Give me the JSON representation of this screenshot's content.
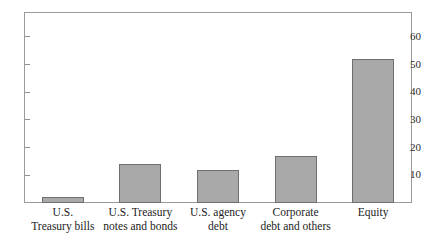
{
  "chart_data": {
    "type": "bar",
    "title": "",
    "xlabel": "",
    "ylabel": "",
    "ylim": [
      0,
      69
    ],
    "grid": false,
    "legend": false,
    "yticks": [
      10,
      20,
      30,
      40,
      50,
      60
    ],
    "ytick_labels": [
      "10",
      "20",
      "30",
      "40",
      "50",
      "60"
    ],
    "categories": [
      "U.S. Treasury bills",
      "U.S. Treasury notes and bonds",
      "U.S. agency debt",
      "Corporate debt and others",
      "Equity"
    ],
    "category_lines": [
      {
        "line1": "U.S.",
        "line2": "Treasury bills"
      },
      {
        "line1": "U.S. Treasury",
        "line2": "notes and bonds"
      },
      {
        "line1": "U.S. agency",
        "line2": "debt"
      },
      {
        "line1": "Corporate",
        "line2": "debt and others"
      },
      {
        "line1": "Equity",
        "line2": ""
      }
    ],
    "values": [
      2,
      14,
      12,
      17,
      52
    ],
    "bar_color": "#a9a9a9",
    "bar_border_color": "#6f6f6f",
    "axis_color": "#9a9a9a",
    "background": "#ffffff"
  }
}
